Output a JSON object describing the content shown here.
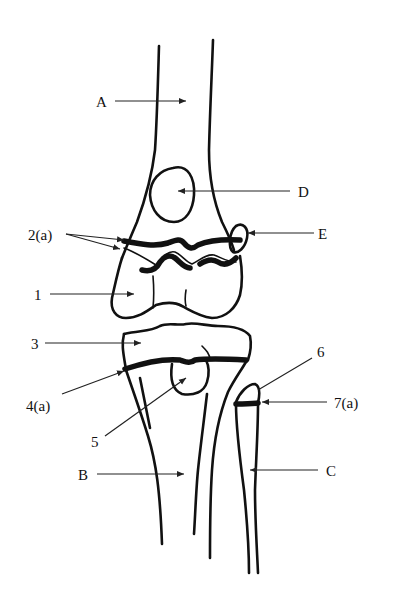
{
  "diagram": {
    "labels": {
      "A": "A",
      "B": "B",
      "C": "C",
      "D": "D",
      "E": "E",
      "l1": "1",
      "l2a": "2(a)",
      "l3": "3",
      "l4a": "4(a)",
      "l5": "5",
      "l6": "6",
      "l7a": "7(a)"
    }
  }
}
